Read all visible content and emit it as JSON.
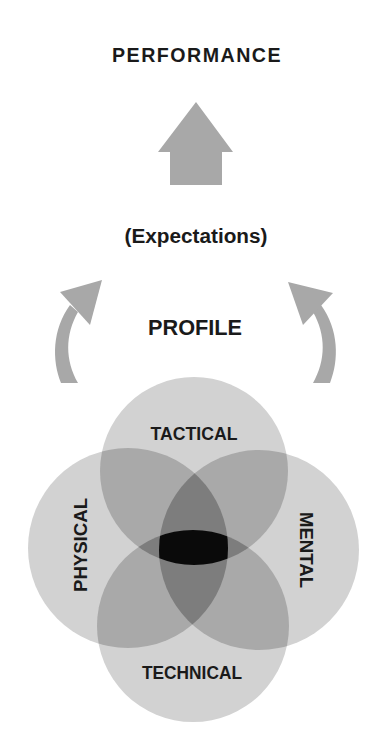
{
  "diagram": {
    "title": "PERFORMANCE",
    "subtitle": "(Expectations)",
    "center_label": "PROFILE",
    "arrows": {
      "up_arrow": "block-arrow-up",
      "left_arrow": "curved-arrow-up-left",
      "right_arrow": "curved-arrow-up-right"
    },
    "circles": [
      {
        "name": "tactical",
        "label": "TACTICAL",
        "position": "top"
      },
      {
        "name": "physical",
        "label": "PHYSICAL",
        "position": "left"
      },
      {
        "name": "mental",
        "label": "MENTAL",
        "position": "right"
      },
      {
        "name": "technical",
        "label": "TECHNICAL",
        "position": "bottom"
      }
    ],
    "colors": {
      "single": "#d2d2d2",
      "double": "#a9a9a9",
      "triple": "#7d7d7d",
      "center": "#0a0a0a",
      "arrow": "#a8a8a8",
      "text": "#1a1a1a"
    }
  }
}
